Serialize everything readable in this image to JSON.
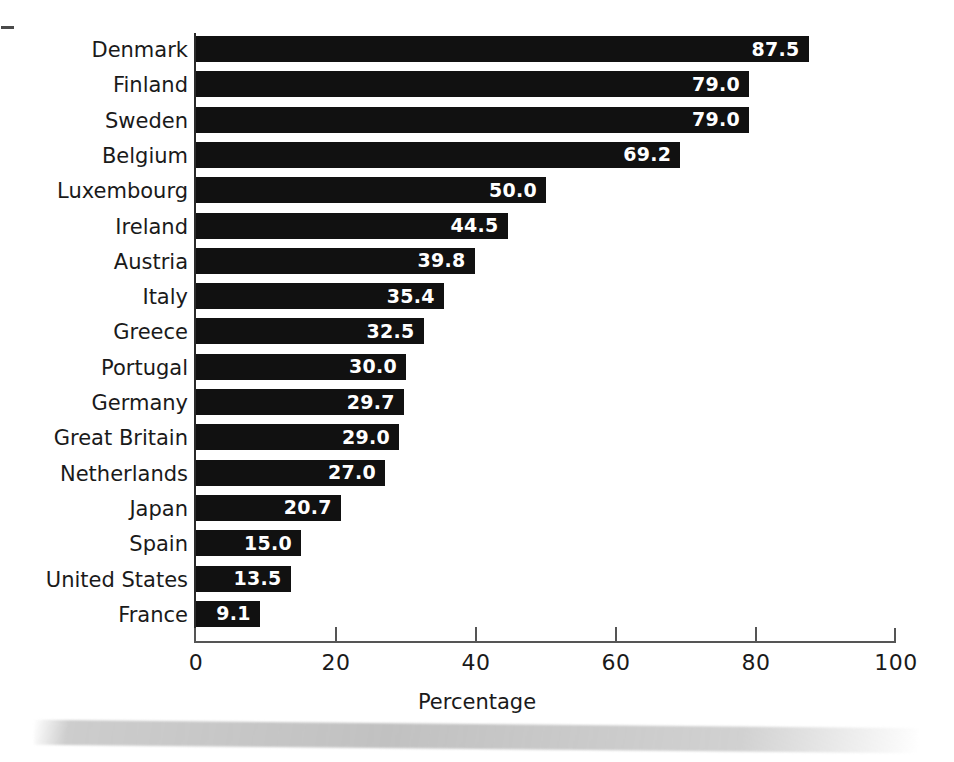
{
  "chart_data": {
    "type": "bar",
    "orientation": "horizontal",
    "title": "",
    "xlabel": "Percentage",
    "ylabel": "",
    "xlim": [
      0,
      100
    ],
    "xticks": [
      0,
      20,
      40,
      60,
      80,
      100
    ],
    "xtick_labels": [
      "0",
      "20",
      "40",
      "60",
      "80",
      "100"
    ],
    "grid": false,
    "legend": null,
    "value_label_format": "one-decimal",
    "categories": [
      "Denmark",
      "Finland",
      "Sweden",
      "Belgium",
      "Luxembourg",
      "Ireland",
      "Austria",
      "Italy",
      "Greece",
      "Portugal",
      "Germany",
      "Great Britain",
      "Netherlands",
      "Japan",
      "Spain",
      "United States",
      "France"
    ],
    "values": [
      87.5,
      79.0,
      79.0,
      69.2,
      50.0,
      44.5,
      39.8,
      35.4,
      32.5,
      30.0,
      29.7,
      29.0,
      27.0,
      20.7,
      15.0,
      13.5,
      9.1
    ],
    "value_labels": [
      "87.5",
      "79.0",
      "79.0",
      "69.2",
      "50.0",
      "44.5",
      "39.8",
      "35.4",
      "32.5",
      "30.0",
      "29.7",
      "29.0",
      "27.0",
      "20.7",
      "15.0",
      "13.5",
      "9.1"
    ],
    "bar_color": "#111111",
    "value_label_color": "#ffffff",
    "axis_color": "#555555"
  },
  "axis": {
    "x_title": "Percentage"
  }
}
